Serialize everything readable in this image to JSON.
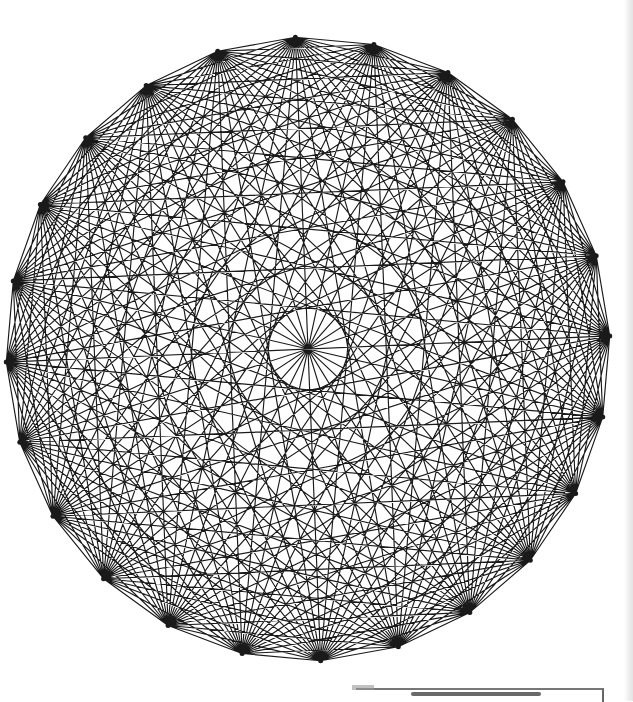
{
  "figure": {
    "vertex_count": 24,
    "edge_count": 276,
    "layout": {
      "center_x": 308,
      "center_y": 349,
      "radius_x": 302,
      "radius_y": 312,
      "start_angle_deg": -92.4
    },
    "colors": {
      "background": "#ffffff",
      "edge": "#1a1a1a"
    },
    "edge_width": 1.15
  }
}
